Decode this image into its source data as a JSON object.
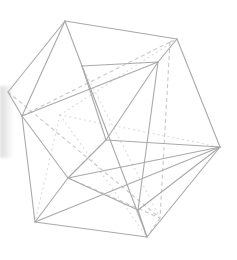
{
  "figure": {
    "colors": {
      "background": "#ffffff",
      "front_edge": "#a9a9a9",
      "hidden_edge_dashed": "#c8c8c8",
      "hidden_edge_dotted": "#dcdcdc"
    },
    "vertices": {
      "T": [
        65,
        21
      ],
      "UR": [
        177,
        39
      ],
      "R": [
        220,
        147
      ],
      "BR": [
        147,
        237
      ],
      "BL": [
        35,
        222
      ],
      "L": [
        8,
        92
      ],
      "L2": [
        22,
        116
      ],
      "F1": [
        82,
        66
      ],
      "F2": [
        158,
        62
      ],
      "F3": [
        106,
        140
      ],
      "F4": [
        68,
        178
      ],
      "F5": [
        138,
        210
      ],
      "H1": [
        170,
        42
      ],
      "H2": [
        160,
        218
      ],
      "H3": [
        60,
        115
      ]
    },
    "solid_edges": [
      [
        "T",
        "UR"
      ],
      [
        "UR",
        "R"
      ],
      [
        "R",
        "BR"
      ],
      [
        "BR",
        "BL"
      ],
      [
        "BL",
        "L2"
      ],
      [
        "L2",
        "L"
      ],
      [
        "L",
        "T"
      ],
      [
        "T",
        "F1"
      ],
      [
        "T",
        "L2"
      ],
      [
        "UR",
        "F2"
      ],
      [
        "F1",
        "F2"
      ],
      [
        "F1",
        "F3"
      ],
      [
        "F2",
        "F3"
      ],
      [
        "F1",
        "BR"
      ],
      [
        "L2",
        "F2"
      ],
      [
        "F2",
        "F5"
      ],
      [
        "R",
        "F5"
      ],
      [
        "R",
        "F4"
      ],
      [
        "F3",
        "F4"
      ],
      [
        "F4",
        "BL"
      ],
      [
        "BL",
        "R"
      ],
      [
        "F5",
        "BR"
      ],
      [
        "F4",
        "F5"
      ],
      [
        "L2",
        "F4"
      ],
      [
        "F3",
        "R"
      ]
    ],
    "dashed_edges": [
      [
        "L2",
        "H1"
      ],
      [
        "H1",
        "UR"
      ],
      [
        "H1",
        "H2"
      ],
      [
        "H2",
        "BR"
      ],
      [
        "L",
        "H2"
      ],
      [
        "F4",
        "H2"
      ]
    ],
    "dotted_edges": [
      [
        "F1",
        "H2"
      ],
      [
        "H3",
        "R"
      ],
      [
        "H3",
        "BR"
      ],
      [
        "H3",
        "UR"
      ],
      [
        "H3",
        "BL"
      ]
    ]
  }
}
